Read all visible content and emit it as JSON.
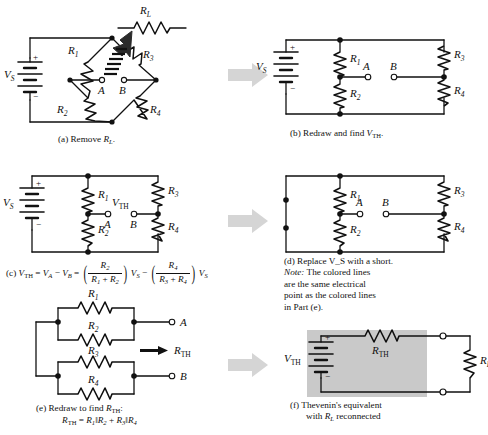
{
  "figure": {
    "ink_color": "#111111",
    "arrow_color": "#d5d5d5",
    "shade_color": "#c9c9c9"
  },
  "labels": {
    "vs": "V",
    "vs_sub": "S",
    "vth": "V",
    "vth_sub": "TH",
    "rth": "R",
    "rth_sub": "TH",
    "rl": "R",
    "rl_sub": "L",
    "r1": "R",
    "r1_sub": "1",
    "r2": "R",
    "r2_sub": "2",
    "r3": "R",
    "r3_sub": "3",
    "r4": "R",
    "r4_sub": "4",
    "node_a": "A",
    "node_b": "B",
    "plus": "+",
    "minus": "−"
  },
  "panels": [
    {
      "id": "a",
      "caption_prefix": "(a) Remove ",
      "caption_term": "R",
      "caption_term_sub": "L",
      "caption_suffix": ".",
      "description": "Bridge circuit with source VS on left, R1 and R3 upper arms, R2 and R4 lower arms, terminals A and B at center, load RL being pulled away with motion blur arrow"
    },
    {
      "id": "b",
      "caption_prefix": "(b) Redraw and find ",
      "caption_term": "V",
      "caption_term_sub": "TH",
      "caption_suffix": ".",
      "description": "Redrawn ladder: VS across two vertical branches R1/R2 and R3/R4, terminals A and B"
    },
    {
      "id": "c",
      "caption_prefix": "(c) ",
      "equation": "V_TH = V_A - V_B = (R2/(R1+R2))VS - (R4/(R3+R4))VS",
      "description": "Same ladder labeled with VTH across terminals A and B"
    },
    {
      "id": "d",
      "caption_lines": [
        "(d) Replace V_S with a short.",
        "Note: The colored lines",
        "are the same electrical",
        "point as the colored lines",
        "in Part (e)."
      ],
      "note_word": "Note:",
      "description": "Source replaced by short; left branch is plain wire with two junction dots"
    },
    {
      "id": "e",
      "caption_prefix": "(e) Redraw to find ",
      "caption_term": "R",
      "caption_term_sub": "TH",
      "caption_suffix": ":",
      "equation": "R_TH = R1 || R2 + R3 || R4",
      "description": "R1 parallel R2 in series with R3 parallel R4 between terminals A and B"
    },
    {
      "id": "f",
      "caption_lines": [
        "(f) Thevenin's equivalent",
        "with R_L reconnected"
      ],
      "description": "VTH source in series with RTH inside shaded box, feeding RL across open terminals"
    }
  ],
  "equations": {
    "c": {
      "lhs1": "V",
      "lhs1_sub": "TH",
      "eq1": "=",
      "lhs2": "V",
      "lhs2_sub": "A",
      "minus1": "−",
      "lhs3": "V",
      "lhs3_sub": "B",
      "eq2": "=",
      "f1_num": "R",
      "f1_num_sub": "2",
      "f1_den_a": "R",
      "f1_den_a_sub": "1",
      "f1_den_plus": "+",
      "f1_den_b": "R",
      "f1_den_b_sub": "2",
      "mult1": "V",
      "mult1_sub": "S",
      "minus2": "−",
      "f2_num": "R",
      "f2_num_sub": "4",
      "f2_den_a": "R",
      "f2_den_a_sub": "3",
      "f2_den_plus": "+",
      "f2_den_b": "R",
      "f2_den_b_sub": "4",
      "mult2": "V",
      "mult2_sub": "S"
    },
    "e": {
      "lhs": "R",
      "lhs_sub": "TH",
      "eq": "=",
      "t1": "R",
      "t1_sub": "1",
      "par1": "‖",
      "t2": "R",
      "t2_sub": "2",
      "plus": "+",
      "t3": "R",
      "t3_sub": "3",
      "par2": "‖",
      "t4": "R",
      "t4_sub": "4"
    }
  },
  "arrows": [
    {
      "id": "arrow-a-to-b",
      "direction": "right"
    },
    {
      "id": "arrow-c-to-d",
      "direction": "right"
    },
    {
      "id": "arrow-e-to-f",
      "direction": "right"
    },
    {
      "id": "arrow-rth-pointer",
      "direction": "left"
    }
  ]
}
